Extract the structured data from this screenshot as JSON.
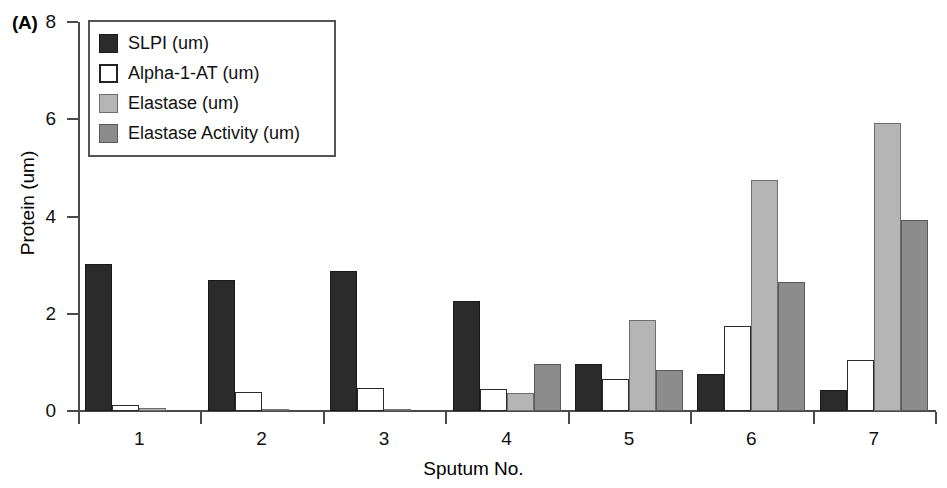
{
  "panel": {
    "label": "(A)"
  },
  "axes": {
    "y_title": "Protein (um)",
    "x_title": "Sputum No.",
    "y_ticks": [
      "0",
      "2",
      "4",
      "6",
      "8"
    ],
    "x_ticks": [
      "1",
      "2",
      "3",
      "4",
      "5",
      "6",
      "7"
    ]
  },
  "legend": {
    "items": [
      {
        "label": "SLPI (um)",
        "swatch": "black-filled-square-icon",
        "color": "#2b2b2b"
      },
      {
        "label": "Alpha-1-AT (um)",
        "swatch": "white-open-square-icon",
        "color": "#ffffff"
      },
      {
        "label": "Elastase (um)",
        "swatch": "light-gray-square-icon",
        "color": "#b5b5b5"
      },
      {
        "label": "Elastase Activity (um)",
        "swatch": "dark-gray-square-icon",
        "color": "#8c8c8c"
      }
    ]
  },
  "chart_data": {
    "type": "bar",
    "title": "",
    "xlabel": "Sputum No.",
    "ylabel": "Protein (um)",
    "ylim": [
      0,
      8
    ],
    "yticks": [
      0,
      2,
      4,
      6,
      8
    ],
    "grid": false,
    "legend_position": "top-left-inside",
    "categories": [
      "1",
      "2",
      "3",
      "4",
      "5",
      "6",
      "7"
    ],
    "series": [
      {
        "name": "SLPI (um)",
        "color": "#2b2b2b",
        "values": [
          3.02,
          2.7,
          2.88,
          2.27,
          0.97,
          0.77,
          0.43
        ]
      },
      {
        "name": "Alpha-1-AT (um)",
        "color": "#ffffff",
        "values": [
          0.12,
          0.4,
          0.48,
          0.45,
          0.65,
          1.75,
          1.04
        ]
      },
      {
        "name": "Elastase (um)",
        "color": "#b5b5b5",
        "values": [
          0.06,
          0.04,
          0.03,
          0.37,
          1.87,
          4.75,
          5.92
        ]
      },
      {
        "name": "Elastase Activity (um)",
        "color": "#8c8c8c",
        "values": [
          0.0,
          0.0,
          0.0,
          0.97,
          0.85,
          2.65,
          3.92
        ]
      }
    ]
  }
}
